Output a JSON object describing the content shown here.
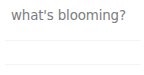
{
  "widget": {
    "heading": "what's blooming?",
    "background_color": "#ffffff",
    "heading_color": "#7c7c80",
    "divider_color": "#f4f4f5",
    "dividers": [
      {
        "name": "divider-top"
      },
      {
        "name": "divider-bottom"
      }
    ],
    "rows": [
      {
        "label": ""
      },
      {
        "label": ""
      }
    ]
  }
}
